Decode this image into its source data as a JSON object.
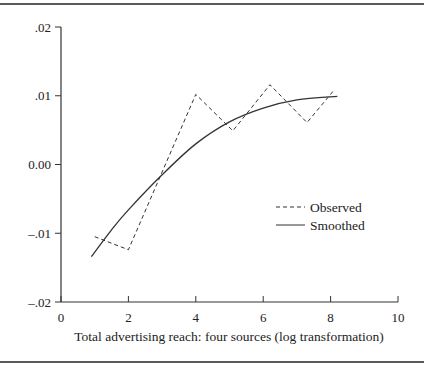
{
  "chart_data": {
    "type": "line",
    "title": "",
    "xlabel": "Total advertising reach: four sources (log transformation)",
    "ylabel": "",
    "xlim": [
      0,
      10
    ],
    "ylim": [
      -0.02,
      0.02
    ],
    "x_ticks": [
      0,
      2,
      4,
      6,
      8,
      10
    ],
    "x_tick_labels": [
      "0",
      "2",
      "4",
      "6",
      "8",
      "10"
    ],
    "y_ticks": [
      0.02,
      0.01,
      0.0,
      -0.01,
      -0.02
    ],
    "y_tick_labels": [
      ".02",
      ".01",
      "0.00",
      "–.01",
      "–.02"
    ],
    "grid": false,
    "legend_position": "right-middle",
    "series": [
      {
        "name": "Observed",
        "style": "dashed",
        "x": [
          1.0,
          2.0,
          4.0,
          5.1,
          6.2,
          7.3,
          8.1
        ],
        "y": [
          -0.0105,
          -0.0124,
          0.0102,
          0.0049,
          0.0116,
          0.0061,
          0.0108
        ]
      },
      {
        "name": "Smoothed",
        "style": "solid",
        "x": [
          0.9,
          1.5,
          2.0,
          3.0,
          4.0,
          5.0,
          6.0,
          7.0,
          8.2
        ],
        "y": [
          -0.0134,
          -0.0095,
          -0.0066,
          -0.0015,
          0.003,
          0.0062,
          0.0082,
          0.0094,
          0.0099
        ]
      }
    ]
  },
  "legend": {
    "observed_label": "Observed",
    "smoothed_label": "Smoothed"
  },
  "axes": {
    "xlabel": "Total advertising reach: four sources (log transformation)",
    "x_tick_labels": [
      "0",
      "2",
      "4",
      "6",
      "8",
      "10"
    ],
    "y_tick_labels": [
      ".02",
      ".01",
      "0.00",
      "–.01",
      "–.02"
    ]
  }
}
